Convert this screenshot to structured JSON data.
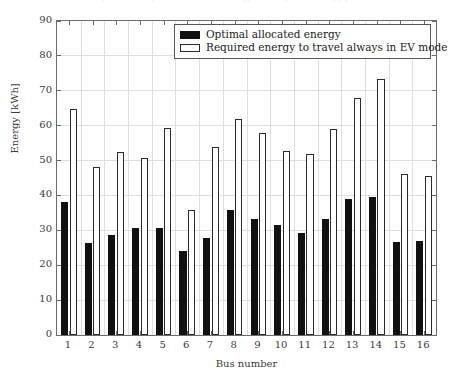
{
  "figure": {
    "title_cutoff": "Comparison of optimal allocated energy and required energy per bus",
    "ylabel": "Energy [kWh]",
    "xlabel": "Bus number"
  },
  "legend": {
    "entries": [
      {
        "label": "Optimal allocated energy",
        "swatch": "filled-black-rect"
      },
      {
        "label": "Required energy to travel always in EV mode",
        "swatch": "open-white-rect"
      }
    ]
  },
  "axes": {
    "y_ticks": [
      "0",
      "10",
      "20",
      "30",
      "40",
      "50",
      "60",
      "70",
      "80",
      "90"
    ],
    "x_ticks": [
      "1",
      "2",
      "3",
      "4",
      "5",
      "6",
      "7",
      "8",
      "9",
      "10",
      "11",
      "12",
      "13",
      "14",
      "15",
      "16"
    ]
  },
  "colors": {
    "optimal": "#111111",
    "required_fill": "#ffffff",
    "required_edge": "#2a2a2a",
    "grid": "#dedede",
    "frame": "#6b6b6b",
    "text": "#1a1a1a",
    "background": "#ffffff"
  },
  "chart_data": {
    "type": "bar",
    "title": "",
    "xlabel": "Bus number",
    "ylabel": "Energy [kWh]",
    "categories": [
      "1",
      "2",
      "3",
      "4",
      "5",
      "6",
      "7",
      "8",
      "9",
      "10",
      "11",
      "12",
      "13",
      "14",
      "15",
      "16"
    ],
    "series": [
      {
        "name": "Optimal allocated energy",
        "color": "#111111",
        "values": [
          38.0,
          26.5,
          28.6,
          30.8,
          30.6,
          24.1,
          27.8,
          35.8,
          33.2,
          31.5,
          29.1,
          33.3,
          38.9,
          39.7,
          26.7,
          26.9
        ]
      },
      {
        "name": "Required energy to travel always in EV mode",
        "color": "#ffffff",
        "values": [
          64.7,
          48.1,
          52.4,
          50.8,
          59.4,
          35.9,
          54.0,
          61.8,
          57.8,
          52.8,
          51.8,
          59.1,
          67.9,
          73.5,
          46.2,
          45.6
        ]
      }
    ],
    "ylim": [
      0,
      90
    ],
    "ytick_step": 10,
    "grid": true,
    "legend_position": "top-center-inside"
  }
}
